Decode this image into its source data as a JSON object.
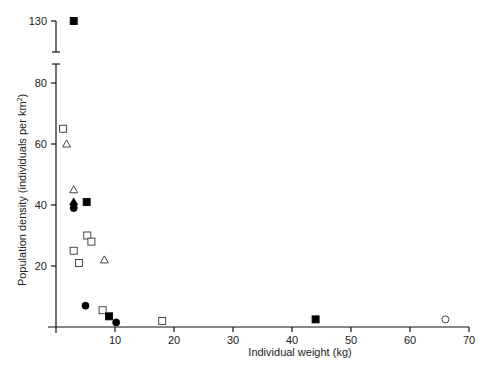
{
  "chart_data": {
    "type": "scatter",
    "title": "",
    "xlabel": "Individual weight (kg)",
    "ylabel": "Population density (individuals per km²)",
    "xlim": [
      0,
      70
    ],
    "ylim": [
      0,
      85
    ],
    "y_axis_break": {
      "from": 85,
      "to": 125,
      "upper_tick": 130
    },
    "x_ticks": [
      10,
      20,
      30,
      40,
      50,
      60,
      70
    ],
    "y_ticks": [
      20,
      40,
      60,
      80,
      130
    ],
    "grid": false,
    "legend": null,
    "series": [
      {
        "name": "open-square",
        "marker": "square",
        "filled": false,
        "points": [
          [
            1.2,
            65
          ],
          [
            5.3,
            30
          ],
          [
            6,
            28
          ],
          [
            3,
            25
          ],
          [
            3.9,
            21
          ],
          [
            7.9,
            5.5
          ],
          [
            18,
            2
          ]
        ]
      },
      {
        "name": "filled-square",
        "marker": "square",
        "filled": true,
        "points": [
          [
            3,
            130
          ],
          [
            5.2,
            41
          ],
          [
            9,
            3.5
          ],
          [
            44,
            2.5
          ]
        ]
      },
      {
        "name": "open-triangle",
        "marker": "triangle",
        "filled": false,
        "points": [
          [
            1.8,
            60
          ],
          [
            3,
            45
          ],
          [
            8.2,
            22
          ]
        ]
      },
      {
        "name": "filled-triangle",
        "marker": "triangle",
        "filled": true,
        "points": [
          [
            3,
            41
          ]
        ]
      },
      {
        "name": "filled-circle",
        "marker": "circle",
        "filled": true,
        "points": [
          [
            3,
            39
          ],
          [
            5,
            7
          ],
          [
            10.2,
            1.5
          ]
        ]
      },
      {
        "name": "open-circle",
        "marker": "circle",
        "filled": false,
        "points": [
          [
            66,
            2.5
          ]
        ]
      }
    ]
  },
  "labels": {
    "xlabel": "Individual weight (kg)",
    "ylabel_main": "Population density (individuals per km",
    "ylabel_sup": "2",
    "ylabel_end": ")"
  }
}
